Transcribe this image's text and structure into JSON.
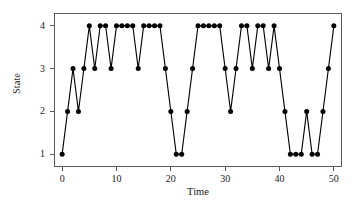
{
  "chart_data": {
    "type": "line",
    "title": "",
    "xlabel": "Time",
    "ylabel": "State",
    "x": [
      0,
      1,
      2,
      3,
      4,
      5,
      6,
      7,
      8,
      9,
      10,
      11,
      12,
      13,
      14,
      15,
      16,
      17,
      18,
      19,
      20,
      21,
      22,
      23,
      24,
      25,
      26,
      27,
      28,
      29,
      30,
      31,
      32,
      33,
      34,
      35,
      36,
      37,
      38,
      39,
      40,
      41,
      42,
      43,
      44,
      45,
      46,
      47,
      48,
      49,
      50
    ],
    "values": [
      1,
      2,
      3,
      2,
      3,
      4,
      3,
      4,
      4,
      3,
      4,
      4,
      4,
      4,
      3,
      4,
      4,
      4,
      4,
      3,
      2,
      1,
      1,
      2,
      3,
      4,
      4,
      4,
      4,
      4,
      3,
      2,
      3,
      4,
      4,
      3,
      4,
      4,
      3,
      4,
      3,
      2,
      1,
      1,
      1,
      2,
      1,
      1,
      2,
      3,
      4
    ],
    "series": [
      {
        "name": "State sequence",
        "values": [
          1,
          2,
          3,
          2,
          3,
          4,
          3,
          4,
          4,
          3,
          4,
          4,
          4,
          4,
          3,
          4,
          4,
          4,
          4,
          3,
          2,
          1,
          1,
          2,
          3,
          4,
          4,
          4,
          4,
          4,
          3,
          2,
          3,
          4,
          4,
          3,
          4,
          4,
          3,
          4,
          3,
          2,
          1,
          1,
          1,
          2,
          1,
          1,
          2,
          3,
          4
        ]
      }
    ],
    "xlim": [
      -1.5,
      51.5
    ],
    "ylim": [
      0.7,
      4.3
    ],
    "xticks": [
      0,
      10,
      20,
      30,
      40,
      50
    ],
    "xtick_labels": [
      "0",
      "10",
      "20",
      "30",
      "40",
      "50"
    ],
    "yticks": [
      1,
      2,
      3,
      4
    ],
    "ytick_labels": [
      "1",
      "2",
      "3",
      "4"
    ],
    "grid": false,
    "legend": null,
    "marker": "filled-circle",
    "marker_color": "#000000",
    "line_color": "#000000",
    "frame_color": "#5a5a5a",
    "background": "#ffffff"
  }
}
